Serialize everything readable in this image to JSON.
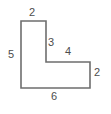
{
  "figure": {
    "kind": "l-shaped-polygon",
    "stroke_color": "#6e6e6e",
    "fill_color": "#ffffff",
    "text_color": "#4d4d4d",
    "background_color": "#ffffff",
    "stroke_width": 1.6,
    "vertices": [
      [
        21,
        21
      ],
      [
        46,
        21
      ],
      [
        46,
        62
      ],
      [
        90,
        62
      ],
      [
        90,
        88
      ],
      [
        21,
        88
      ]
    ],
    "path": "M21,21 L46,21 L46,62 L90,62 L90,88 L21,88 Z"
  },
  "labels": {
    "top": "2",
    "left": "5",
    "inner_vertical": "3",
    "inner_horizontal": "4",
    "right": "2",
    "bottom": "6"
  }
}
